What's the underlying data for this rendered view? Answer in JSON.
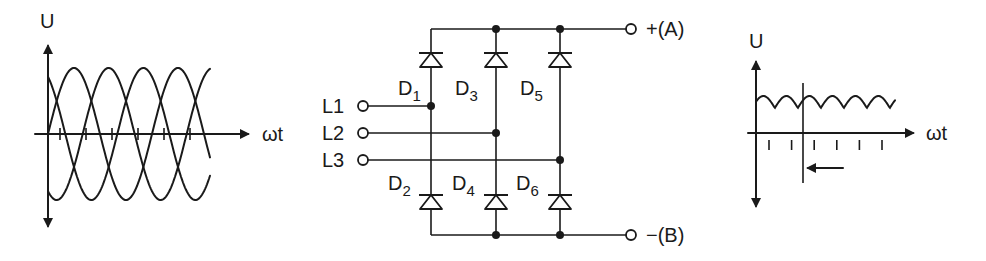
{
  "left_graph": {
    "y_label": "U",
    "x_label": "ωt",
    "description": "Three-phase sinusoidal voltages, 120° phase shift",
    "phases": 3,
    "phase_shift_deg": 120,
    "tick_count": 6
  },
  "circuit": {
    "description": "Three-phase full-wave bridge rectifier (B6)",
    "inputs": [
      {
        "label": "L1"
      },
      {
        "label": "L2"
      },
      {
        "label": "L3"
      }
    ],
    "diodes": [
      {
        "letter": "D",
        "index": "1"
      },
      {
        "letter": "D",
        "index": "2"
      },
      {
        "letter": "D",
        "index": "3"
      },
      {
        "letter": "D",
        "index": "4"
      },
      {
        "letter": "D",
        "index": "5"
      },
      {
        "letter": "D",
        "index": "6"
      }
    ],
    "outputs": {
      "positive": "+(A)",
      "negative": "−(B)"
    }
  },
  "right_graph": {
    "y_label": "U",
    "x_label": "ωt",
    "description": "Rectified DC output voltage with 6-pulse ripple",
    "tick_count": 6
  },
  "colors": {
    "ink": "#1a1a1a",
    "background": "#ffffff"
  }
}
